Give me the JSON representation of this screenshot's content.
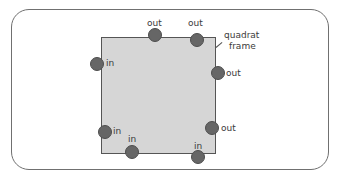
{
  "diagram": {
    "frame_label": [
      "quadrat",
      "frame"
    ],
    "colors": {
      "frame_fill": "#d6d6d6",
      "dot_fill": "#666666",
      "outline": "#707070"
    },
    "markers": [
      {
        "id": "left-top",
        "label": "in",
        "x": 97,
        "y": 64
      },
      {
        "id": "top-mid",
        "label": "out",
        "x": 155,
        "y": 35
      },
      {
        "id": "top-right",
        "label": "out",
        "x": 197,
        "y": 40
      },
      {
        "id": "right-upper",
        "label": "out",
        "x": 218,
        "y": 73
      },
      {
        "id": "left-lower",
        "label": "in",
        "x": 105,
        "y": 132
      },
      {
        "id": "bottom-left",
        "label": "in",
        "x": 132,
        "y": 152
      },
      {
        "id": "right-lower",
        "label": "out",
        "x": 212,
        "y": 128
      },
      {
        "id": "bottom-right",
        "label": "in",
        "x": 198,
        "y": 157
      }
    ]
  }
}
